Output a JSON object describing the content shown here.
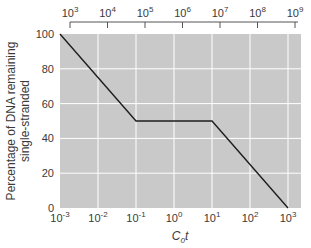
{
  "chart_data": {
    "type": "line",
    "title": "",
    "xlabel": "C0t",
    "xlabel_main": "C",
    "xlabel_sub": "0",
    "xlabel_suffix": "t",
    "ylabel_line1": "Percentage of DNA remaining",
    "ylabel_line2": "single-stranded",
    "ylabel": "Percentage of DNA remaining single-stranded",
    "x_scale": "log",
    "xlim": [
      0.001,
      3000
    ],
    "ylim": [
      0,
      100
    ],
    "grid": true,
    "bottom_axis": {
      "ticks": [
        {
          "base": "10",
          "exp": "-3",
          "value": 0.001
        },
        {
          "base": "10",
          "exp": "-2",
          "value": 0.01
        },
        {
          "base": "10",
          "exp": "-1",
          "value": 0.1
        },
        {
          "base": "10",
          "exp": "0",
          "value": 1
        },
        {
          "base": "10",
          "exp": "1",
          "value": 10
        },
        {
          "base": "10",
          "exp": "2",
          "value": 100
        },
        {
          "base": "10",
          "exp": "3",
          "value": 1000
        }
      ]
    },
    "top_axis": {
      "ticks": [
        {
          "base": "10",
          "exp": "3",
          "value": 1000
        },
        {
          "base": "10",
          "exp": "4",
          "value": 10000
        },
        {
          "base": "10",
          "exp": "5",
          "value": 100000
        },
        {
          "base": "10",
          "exp": "6",
          "value": 1000000
        },
        {
          "base": "10",
          "exp": "7",
          "value": 10000000
        },
        {
          "base": "10",
          "exp": "8",
          "value": 100000000
        },
        {
          "base": "10",
          "exp": "9",
          "value": 1000000000
        }
      ]
    },
    "y_ticks": [
      0,
      20,
      40,
      60,
      80,
      100
    ],
    "series": [
      {
        "name": "Reassociation curve",
        "x": [
          0.001,
          0.1,
          10,
          1000
        ],
        "y": [
          100,
          50,
          50,
          0
        ]
      }
    ],
    "colors": {
      "plot_bg": "#c9c9c9",
      "grid": "#ffffff",
      "line": "#1e1e1e",
      "text": "#3a3a3a"
    }
  }
}
